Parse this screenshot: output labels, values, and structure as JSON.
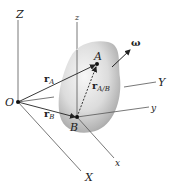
{
  "figure": {
    "colors": {
      "axis": "#555555",
      "vector": "#222222",
      "body_light": "#f2f2f2",
      "body_dark": "#9a9a9a",
      "point": "#111111"
    },
    "fixed_frame": {
      "origin_label": "O",
      "axes": {
        "X": "X",
        "Y": "Y",
        "Z": "Z"
      }
    },
    "body_frame": {
      "origin_label": "B",
      "axes": {
        "x": "x",
        "y": "y",
        "z": "z"
      }
    },
    "points": {
      "A": "A",
      "B": "B"
    },
    "vectors": {
      "r_A": {
        "base": "r",
        "sub": "A"
      },
      "r_B": {
        "base": "r",
        "sub": "B"
      },
      "r_AB": {
        "base": "r",
        "sub": "A/B"
      },
      "omega": "ω"
    }
  }
}
